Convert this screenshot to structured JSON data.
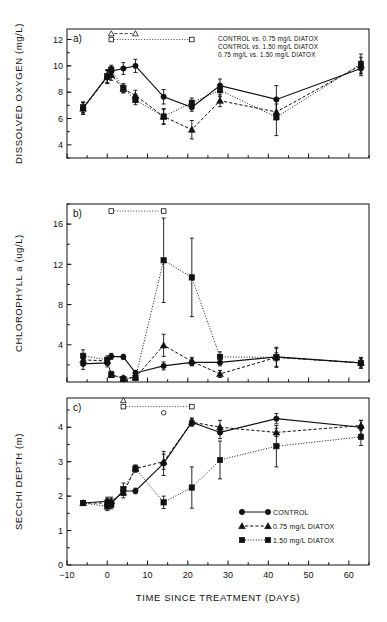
{
  "figure": {
    "xlabel": "TIME SINCE TREATMENT (DAYS)",
    "panel_a_label": "a)",
    "panel_b_label": "b)",
    "panel_c_label": "c)"
  },
  "annotations": {
    "line1": "CONTROL vs. 0.75 mg/L DIATOX",
    "line2": "CONTROL vs. 1.50 mg/L DIATOX",
    "line3": "0.75 mg/L vs. 1.50 mg/L DIATOX"
  },
  "legend": {
    "control": "CONTROL",
    "low": "0.75 mg/L DIATOX",
    "high": "1.50 mg/L DIATOX"
  },
  "axis_ticks": {
    "x": [
      "-10",
      "0",
      "10",
      "20",
      "30",
      "40",
      "50",
      "60"
    ],
    "a": [
      "4",
      "6",
      "8",
      "10",
      "12"
    ],
    "b": [
      "4",
      "8",
      "12",
      "16"
    ],
    "c": [
      "0",
      "1",
      "2",
      "3",
      "4"
    ]
  },
  "chart_data": [
    {
      "type": "line",
      "panel": "a",
      "title": "",
      "xlabel": "TIME SINCE TREATMENT (DAYS)",
      "ylabel": "DISSOLVED OXYGEN (mg/L)",
      "xlim": [
        -10,
        65
      ],
      "ylim": [
        3.0,
        12.8
      ],
      "grid": false,
      "legend_position": "none",
      "series": [
        {
          "name": "CONTROL",
          "marker": "circle",
          "linestyle": "solid",
          "x": [
            -6,
            0,
            1,
            4,
            7,
            14,
            21,
            28,
            42,
            63
          ],
          "y": [
            6.8,
            9.2,
            9.6,
            9.8,
            10.0,
            7.65,
            6.85,
            8.5,
            7.45,
            9.8
          ],
          "yerr": [
            0.45,
            0.5,
            0.35,
            0.45,
            0.5,
            0.55,
            0.3,
            0.5,
            1.05,
            0.55
          ]
        },
        {
          "name": "0.75 mg/L DIATOX",
          "marker": "triangle",
          "linestyle": "dashed",
          "x": [
            -6,
            0,
            1,
            4,
            7,
            14,
            21,
            28,
            42,
            63
          ],
          "y": [
            6.75,
            9.15,
            9.3,
            8.25,
            7.75,
            6.15,
            5.15,
            7.35,
            6.5,
            10.05
          ],
          "yerr": [
            0.45,
            0.5,
            0.4,
            0.3,
            0.4,
            0.55,
            0.7,
            0.45,
            0.6,
            0.6
          ]
        },
        {
          "name": "1.50 mg/L DIATOX",
          "marker": "square",
          "linestyle": "dotted",
          "x": [
            -6,
            0,
            1,
            4,
            7,
            14,
            21,
            28,
            42,
            63
          ],
          "y": [
            6.85,
            9.2,
            9.7,
            8.3,
            7.4,
            6.15,
            7.2,
            8.15,
            6.1,
            10.15
          ],
          "yerr": [
            0.4,
            0.5,
            0.35,
            0.35,
            0.35,
            0.6,
            0.35,
            0.5,
            1.4,
            0.75
          ]
        }
      ],
      "significance_bars": [
        {
          "marker": "triangle",
          "linestyle": "dashed",
          "x_start": 1,
          "x_end": 7,
          "y": 12.45
        },
        {
          "marker": "square",
          "linestyle": "dotted",
          "x_start": 1,
          "x_end": 21,
          "y": 12.0
        }
      ]
    },
    {
      "type": "line",
      "panel": "b",
      "title": "",
      "xlabel": "TIME SINCE TREATMENT (DAYS)",
      "ylabel": "CHLOROPHYLL a (ug/L)",
      "xlim": [
        -10,
        65
      ],
      "ylim": [
        0.3,
        18.0
      ],
      "grid": false,
      "legend_position": "none",
      "series": [
        {
          "name": "CONTROL",
          "marker": "circle",
          "linestyle": "solid",
          "x": [
            -6,
            0,
            1,
            4,
            7,
            14,
            21,
            28,
            42,
            63
          ],
          "y": [
            2.1,
            2.2,
            2.85,
            2.8,
            1.2,
            1.9,
            2.25,
            2.25,
            2.8,
            2.2
          ],
          "yerr": [
            0.55,
            0.4,
            0.3,
            0.25,
            0.25,
            0.4,
            0.35,
            0.35,
            0.4,
            0.4
          ]
        },
        {
          "name": "0.75 mg/L DIATOX",
          "marker": "triangle",
          "linestyle": "dashed",
          "x": [
            -6,
            0,
            1,
            4,
            7,
            14,
            21,
            28,
            42,
            63
          ],
          "y": [
            2.5,
            2.4,
            1.0,
            0.7,
            0.75,
            3.95,
            2.35,
            1.1,
            2.75,
            2.2
          ],
          "yerr": [
            0.5,
            0.35,
            0.25,
            0.2,
            0.2,
            1.1,
            0.4,
            0.35,
            1.0,
            0.5
          ]
        },
        {
          "name": "1.50 mg/L DIATOX",
          "marker": "square",
          "linestyle": "dotted",
          "x": [
            -6,
            0,
            1,
            4,
            7,
            14,
            21,
            28,
            42,
            63
          ],
          "y": [
            2.9,
            2.5,
            1.05,
            0.6,
            0.7,
            12.4,
            10.7,
            2.8,
            2.75,
            2.2
          ],
          "yerr": [
            0.6,
            0.4,
            0.3,
            0.25,
            0.2,
            4.2,
            3.9,
            0.5,
            0.9,
            0.55
          ]
        }
      ],
      "significance_bars": [
        {
          "marker": "square",
          "linestyle": "dotted",
          "x_start": 1,
          "x_end": 14,
          "y": 17.3
        }
      ]
    },
    {
      "type": "line",
      "panel": "c",
      "title": "",
      "xlabel": "TIME SINCE TREATMENT (DAYS)",
      "ylabel": "SECCHI DEPTH (m)",
      "xlim": [
        -10,
        65
      ],
      "ylim": [
        0,
        4.85
      ],
      "grid": false,
      "legend_position": "lower right",
      "series": [
        {
          "name": "CONTROL",
          "marker": "circle",
          "linestyle": "solid",
          "x": [
            -6,
            0,
            1,
            4,
            7,
            14,
            21,
            28,
            42,
            63
          ],
          "y": [
            1.8,
            1.85,
            1.8,
            2.15,
            2.15,
            2.95,
            4.15,
            3.85,
            4.25,
            4.0
          ],
          "yerr": [
            0.05,
            0.12,
            0.12,
            0.12,
            0.08,
            0.35,
            0.1,
            0.18,
            0.15,
            0.2
          ]
        },
        {
          "name": "0.75 mg/L DIATOX",
          "marker": "triangle",
          "linestyle": "dashed",
          "x": [
            -6,
            0,
            1,
            4,
            7,
            14,
            21,
            28,
            42,
            63
          ],
          "y": [
            1.8,
            1.8,
            1.85,
            2.1,
            2.8,
            3.0,
            4.15,
            4.0,
            3.85,
            4.05
          ],
          "yerr": [
            0.05,
            0.12,
            0.12,
            0.15,
            0.1,
            0.22,
            0.12,
            0.2,
            0.12,
            0.15
          ]
        },
        {
          "name": "1.50 mg/L DIATOX",
          "marker": "square",
          "linestyle": "dotted",
          "x": [
            -6,
            0,
            1,
            4,
            7,
            14,
            21,
            28,
            42,
            63
          ],
          "y": [
            1.8,
            1.7,
            1.75,
            2.2,
            2.8,
            1.82,
            2.25,
            3.05,
            3.45,
            3.72
          ],
          "yerr": [
            0.05,
            0.12,
            0.12,
            0.18,
            0.1,
            0.18,
            0.6,
            0.55,
            0.6,
            0.25
          ]
        }
      ],
      "significance_bars": [
        {
          "marker": "triangle",
          "linestyle": "none",
          "x_start": 4,
          "x_end": 4,
          "y": 4.78
        },
        {
          "marker": "square",
          "linestyle": "dotted",
          "x_start": 4,
          "x_end": 21,
          "y": 4.6
        },
        {
          "marker": "circle",
          "linestyle": "none",
          "x_start": 14,
          "x_end": 14,
          "y": 4.42
        }
      ]
    }
  ]
}
